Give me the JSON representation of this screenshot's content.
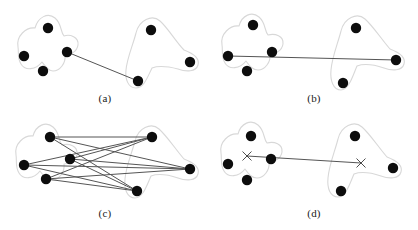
{
  "figure": {
    "type": "diagram",
    "canvas": {
      "width": 418,
      "height": 230
    },
    "style": {
      "background": "#ffffff",
      "node_fill": "#0d0d0d",
      "node_radius": 5.2,
      "blob_stroke": "#d8d8d8",
      "blob_stroke_width": 1.1,
      "blob_fill": "#ffffff",
      "edge_stroke": "#555555",
      "edge_stroke_width": 1.0,
      "cross_stroke": "#3a3a3a",
      "cross_stroke_width": 0.9,
      "caption_color": "#1a1a1a"
    },
    "panels": [
      {
        "id": "a",
        "caption": "(a)",
        "caption_pos": {
          "x": 105,
          "y": 100
        },
        "clusters": [
          {
            "name": "left-cluster",
            "blob": "M 18 47 C 16 36, 26 27, 35 28 C 38 17, 48 12, 55 18 C 62 24, 60 31, 64 36 C 70 34, 79 37, 78 45 C 77 52, 70 55, 65 55 C 66 63, 60 71, 53 71 C 48 71, 45 66, 42 62 C 36 70, 25 71, 21 64 C 17 58, 19 52, 18 47 Z",
            "nodes": [
              {
                "id": "a-l1",
                "x": 48,
                "y": 28
              },
              {
                "id": "a-l2",
                "x": 24,
                "y": 56
              },
              {
                "id": "a-l3",
                "x": 43,
                "y": 71
              },
              {
                "id": "a-l4",
                "x": 67,
                "y": 52
              }
            ]
          },
          {
            "name": "right-cluster",
            "blob": "M 136 33 C 139 20, 152 14, 160 21 C 168 28, 176 42, 184 50 C 192 53, 200 58, 198 65 C 196 72, 186 72, 178 69 C 170 67, 160 65, 152 68 C 148 76, 144 88, 136 88 C 128 88, 125 79, 126 70 C 127 58, 133 45, 136 33 Z",
            "nodes": [
              {
                "id": "a-r1",
                "x": 151,
                "y": 30
              },
              {
                "id": "a-r2",
                "x": 190,
                "y": 62
              },
              {
                "id": "a-r3",
                "x": 138,
                "y": 81
              }
            ]
          }
        ],
        "edges": [
          {
            "from": "a-l4",
            "to": "a-r3",
            "x1": 67,
            "y1": 52,
            "x2": 138,
            "y2": 81
          }
        ],
        "crosses": []
      },
      {
        "id": "b",
        "caption": "(b)",
        "caption_pos": {
          "x": 314,
          "y": 100
        },
        "clusters": [
          {
            "name": "left-cluster",
            "blob": "M 222 45 C 220 34, 230 25, 239 26 C 242 15, 252 11, 259 17 C 266 23, 264 30, 268 35 C 275 33, 284 36, 283 44 C 282 51, 275 54, 270 54 C 271 62, 265 70, 258 70 C 252 70, 249 65, 246 61 C 240 69, 229 70, 225 63 C 221 57, 223 50, 222 45 Z",
            "nodes": [
              {
                "id": "b-l1",
                "x": 253,
                "y": 25
              },
              {
                "id": "b-l2",
                "x": 228,
                "y": 56
              },
              {
                "id": "b-l3",
                "x": 247,
                "y": 71
              },
              {
                "id": "b-l4",
                "x": 272,
                "y": 52
              }
            ]
          },
          {
            "name": "right-cluster",
            "blob": "M 341 31 C 344 18, 357 12, 365 19 C 373 26, 382 40, 390 49 C 398 52, 406 57, 404 64 C 402 71, 392 71, 384 68 C 375 65, 365 63, 357 66 C 353 75, 349 90, 341 90 C 333 90, 330 80, 331 70 C 332 57, 338 43, 341 31 Z",
            "nodes": [
              {
                "id": "b-r1",
                "x": 356,
                "y": 28
              },
              {
                "id": "b-r2",
                "x": 396,
                "y": 60
              },
              {
                "id": "b-r3",
                "x": 343,
                "y": 83
              }
            ]
          }
        ],
        "edges": [
          {
            "from": "b-l2",
            "to": "b-r2",
            "x1": 228,
            "y1": 56,
            "x2": 396,
            "y2": 60
          }
        ],
        "crosses": []
      },
      {
        "id": "c",
        "caption": "(c)",
        "caption_pos": {
          "x": 105,
          "y": 215
        },
        "clusters": [
          {
            "name": "left-cluster",
            "blob": "M 16 155 C 14 144, 24 135, 33 136 C 36 125, 46 121, 53 127 C 60 133, 58 140, 62 145 C 69 143, 78 146, 77 154 C 76 161, 69 164, 64 164 C 65 172, 59 180, 52 180 C 46 180, 43 175, 40 171 C 34 179, 23 180, 19 173 C 15 167, 17 160, 16 155 Z",
            "nodes": [
              {
                "id": "c-l1",
                "x": 50,
                "y": 137
              },
              {
                "id": "c-l2",
                "x": 24,
                "y": 165
              },
              {
                "id": "c-l3",
                "x": 46,
                "y": 179
              },
              {
                "id": "c-l4",
                "x": 70,
                "y": 159
              }
            ]
          },
          {
            "name": "right-cluster",
            "blob": "M 135 141 C 138 128, 151 122, 159 129 C 167 136, 176 150, 184 159 C 192 162, 200 167, 198 174 C 196 181, 186 181, 178 178 C 169 175, 159 173, 151 176 C 147 185, 143 198, 135 198 C 127 198, 124 189, 125 179 C 126 166, 132 153, 135 141 Z",
            "nodes": [
              {
                "id": "c-r1",
                "x": 152,
                "y": 137
              },
              {
                "id": "c-r2",
                "x": 190,
                "y": 169
              },
              {
                "id": "c-r3",
                "x": 137,
                "y": 191
              }
            ]
          }
        ],
        "edges": [
          {
            "from": "c-l1",
            "to": "c-r1",
            "x1": 50,
            "y1": 137,
            "x2": 152,
            "y2": 137
          },
          {
            "from": "c-l1",
            "to": "c-r2",
            "x1": 50,
            "y1": 137,
            "x2": 190,
            "y2": 169
          },
          {
            "from": "c-l1",
            "to": "c-r3",
            "x1": 50,
            "y1": 137,
            "x2": 137,
            "y2": 191
          },
          {
            "from": "c-l2",
            "to": "c-r1",
            "x1": 24,
            "y1": 165,
            "x2": 152,
            "y2": 137
          },
          {
            "from": "c-l2",
            "to": "c-r2",
            "x1": 24,
            "y1": 165,
            "x2": 190,
            "y2": 169
          },
          {
            "from": "c-l2",
            "to": "c-r3",
            "x1": 24,
            "y1": 165,
            "x2": 137,
            "y2": 191
          },
          {
            "from": "c-l3",
            "to": "c-r1",
            "x1": 46,
            "y1": 179,
            "x2": 152,
            "y2": 137
          },
          {
            "from": "c-l3",
            "to": "c-r2",
            "x1": 46,
            "y1": 179,
            "x2": 190,
            "y2": 169
          },
          {
            "from": "c-l3",
            "to": "c-r3",
            "x1": 46,
            "y1": 179,
            "x2": 137,
            "y2": 191
          },
          {
            "from": "c-l4",
            "to": "c-r1",
            "x1": 70,
            "y1": 159,
            "x2": 152,
            "y2": 137
          },
          {
            "from": "c-l4",
            "to": "c-r2",
            "x1": 70,
            "y1": 159,
            "x2": 190,
            "y2": 169
          },
          {
            "from": "c-l4",
            "to": "c-r3",
            "x1": 70,
            "y1": 159,
            "x2": 137,
            "y2": 191
          }
        ],
        "crosses": []
      },
      {
        "id": "d",
        "caption": "(d)",
        "caption_pos": {
          "x": 314,
          "y": 215
        },
        "clusters": [
          {
            "name": "left-cluster",
            "blob": "M 221 153 C 219 142, 229 133, 238 134 C 241 123, 251 119, 258 125 C 265 131, 263 138, 267 143 C 274 141, 283 144, 282 152 C 281 159, 274 162, 269 162 C 270 170, 264 178, 257 178 C 251 178, 248 173, 245 169 C 239 177, 228 178, 224 171 C 220 165, 222 158, 221 153 Z",
            "nodes": [
              {
                "id": "d-l1",
                "x": 251,
                "y": 136
              },
              {
                "id": "d-l2",
                "x": 228,
                "y": 164
              },
              {
                "id": "d-l3",
                "x": 247,
                "y": 180
              },
              {
                "id": "d-l4",
                "x": 271,
                "y": 159
              }
            ]
          },
          {
            "name": "right-cluster",
            "blob": "M 338 139 C 341 126, 354 120, 362 127 C 370 134, 379 148, 387 157 C 395 160, 403 165, 401 172 C 399 179, 389 179, 381 176 C 372 173, 362 171, 354 174 C 350 183, 346 197, 338 197 C 330 197, 327 188, 328 178 C 329 165, 335 151, 338 139 Z",
            "nodes": [
              {
                "id": "d-r1",
                "x": 355,
                "y": 136
              },
              {
                "id": "d-r2",
                "x": 393,
                "y": 168
              },
              {
                "id": "d-r3",
                "x": 341,
                "y": 191
              }
            ]
          }
        ],
        "edges": [
          {
            "from": "d-cross-left",
            "to": "d-cross-right",
            "x1": 247,
            "y1": 156,
            "x2": 361,
            "y2": 163
          }
        ],
        "crosses": [
          {
            "id": "d-cross-left",
            "x": 247,
            "y": 156,
            "size": 4.5
          },
          {
            "id": "d-cross-right",
            "x": 361,
            "y": 163,
            "size": 4.5
          }
        ]
      }
    ]
  }
}
